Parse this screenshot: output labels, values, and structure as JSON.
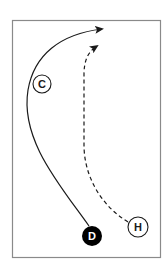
{
  "diagram": {
    "type": "play-diagram",
    "frame": {
      "x": 12,
      "y": 20,
      "width": 149,
      "height": 238,
      "stroke": "#8a8a8a"
    },
    "players": [
      {
        "id": "C",
        "label": "C",
        "style": "outline",
        "cx": 42,
        "cy": 84,
        "r": 9
      },
      {
        "id": "D",
        "label": "D",
        "style": "filled",
        "cx": 92,
        "cy": 236,
        "r": 10
      },
      {
        "id": "H",
        "label": "H",
        "style": "outline",
        "cx": 138,
        "cy": 227,
        "r": 10
      }
    ],
    "paths": [
      {
        "from": "D",
        "style": "solid",
        "ends_with": "arrow",
        "description": "curved run up left side to top"
      },
      {
        "from": "H",
        "style": "dashed",
        "ends_with": "arrow",
        "description": "curved dashed run upward"
      }
    ],
    "colors": {
      "line": "#1a1a1a",
      "frame": "#8a8a8a",
      "filled": "#000000",
      "background": "#ffffff"
    }
  }
}
